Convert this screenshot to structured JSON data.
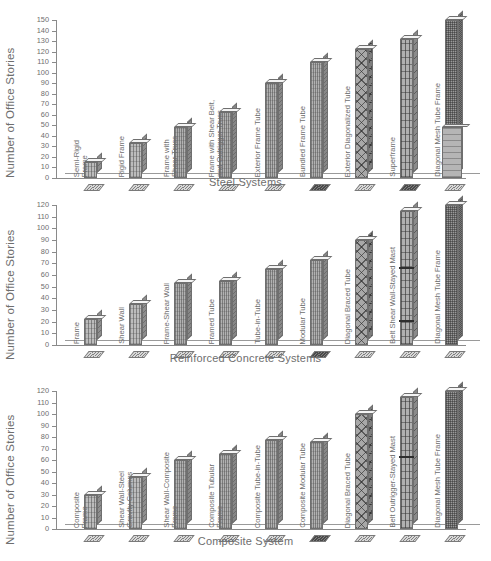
{
  "figure": {
    "ylabel": "Number of Office Stories"
  },
  "chart_data": [
    {
      "type": "bar",
      "title": "",
      "xlabel": "Steel Systems",
      "ylabel": "Number of Office Stories",
      "ylim": [
        0,
        150
      ],
      "ytick_step": 10,
      "yticks": [
        "0",
        "10",
        "20",
        "30",
        "40",
        "50",
        "60",
        "70",
        "80",
        "90",
        "100",
        "110",
        "120",
        "130",
        "140",
        "150"
      ],
      "grid": false,
      "legend": "none",
      "categories": [
        "Semi-Rigid\nFrame",
        "Rigid Frame",
        "Frame with\nShear Truss",
        "Frame with Shear Belt,\nand Outrigger Truss",
        "Exterior Frame Tube",
        "Bundled Frame Tube",
        "Exterior Diagonalized Tube",
        "Superframe",
        "Diagonal Mesh Tube Frame"
      ],
      "values": [
        15,
        33,
        48,
        63,
        90,
        110,
        122,
        132,
        150
      ]
    },
    {
      "type": "bar",
      "title": "",
      "xlabel": "Reinforced Concrete Systems",
      "ylabel": "Number of Office Stories",
      "ylim": [
        0,
        120
      ],
      "ytick_step": 10,
      "yticks": [
        "0",
        "10",
        "20",
        "30",
        "40",
        "50",
        "60",
        "70",
        "80",
        "90",
        "100",
        "110",
        "120"
      ],
      "grid": false,
      "legend": "none",
      "categories": [
        "Frame",
        "Shear Wall",
        "Frame-Shear Wall",
        "Framed Tube",
        "Tube-in-Tube",
        "Modular Tube",
        "Diagonal Braced Tube",
        "Belt Shear Wall-Stayed Mast",
        "Diagonal Mesh Tube Frame"
      ],
      "values": [
        22,
        35,
        53,
        55,
        65,
        73,
        90,
        115,
        120
      ]
    },
    {
      "type": "bar",
      "title": "",
      "xlabel": "Composite System",
      "ylabel": "Number of Office Stories",
      "ylim": [
        0,
        120
      ],
      "ytick_step": 10,
      "yticks": [
        "0",
        "10",
        "20",
        "30",
        "40",
        "50",
        "60",
        "70",
        "80",
        "90",
        "100",
        "110",
        "120"
      ],
      "grid": false,
      "legend": "none",
      "categories": [
        "Composite\nFrame",
        "Shear Wall-Steel\nGravity Columns",
        "Shear Wall-Composite\nFrame",
        "Composite Tubular\nFrame",
        "Composite Tube-in-Tube",
        "Composite Modular Tube",
        "Diagonal Braced Tube",
        "Belt Outrigger-Stayed Mast",
        "Diagonal Mesh Tube Frame"
      ],
      "values": [
        30,
        45,
        60,
        65,
        77,
        76,
        100,
        115,
        120
      ]
    }
  ]
}
